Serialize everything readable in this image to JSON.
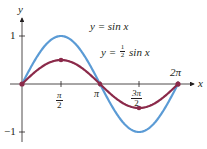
{
  "chart_data": {
    "type": "line",
    "title": "",
    "xlabel": "x",
    "ylabel": "y",
    "x_ticks": [
      "π/2",
      "π",
      "3π/2",
      "2π"
    ],
    "y_ticks": [
      "1",
      "−1"
    ],
    "xlim": [
      0,
      6.2832
    ],
    "ylim": [
      -1,
      1
    ],
    "grid": false,
    "series": [
      {
        "name": "y = sin x",
        "color": "#5b9bd5",
        "x": [
          0,
          1.5708,
          3.1416,
          4.7124,
          6.2832
        ],
        "values": [
          0,
          1,
          0,
          -1,
          0
        ]
      },
      {
        "name": "y = ½ sin x",
        "color": "#8b2a4a",
        "x": [
          0,
          1.5708,
          3.1416,
          4.7124,
          6.2832
        ],
        "values": [
          0,
          0.5,
          0,
          -0.5,
          0
        ],
        "markers": true
      }
    ],
    "annotations": [
      {
        "text": "y = sin x",
        "position": "top center"
      },
      {
        "text": "y = ½ sin x",
        "position": "below first label"
      }
    ]
  },
  "labels": {
    "y_axis": "y",
    "x_axis": "x",
    "tick_one": "1",
    "tick_neg_one": "−1",
    "pi_half_num": "π",
    "pi_half_den": "2",
    "pi": "π",
    "three_pi_half_num": "3π",
    "three_pi_half_den": "2",
    "two_pi": "2π",
    "eq1": "y = sin x",
    "eq2_prefix": "y = ",
    "eq2_num": "1",
    "eq2_den": "2",
    "eq2_suffix": " sin x"
  }
}
